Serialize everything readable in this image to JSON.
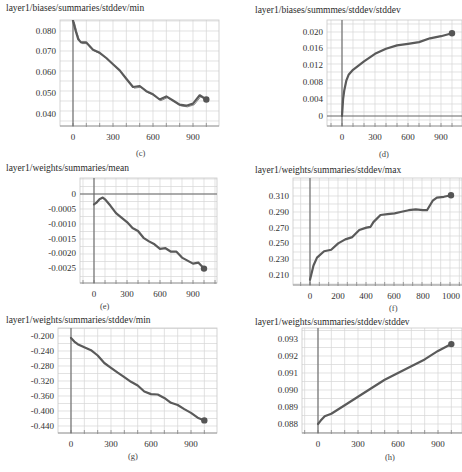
{
  "chart_data": [
    {
      "id": "c",
      "type": "line",
      "title": "layer1/biases/summaries/stddev/min",
      "caption": "(c)",
      "xlabel": "",
      "ylabel": "",
      "x_ticks": [
        "0",
        "300",
        "600",
        "900"
      ],
      "y_ticks": [
        "0.080",
        "0.070",
        "0.060",
        "0.050",
        "0.040"
      ],
      "xlim": [
        -120,
        1080
      ],
      "ylim": [
        0.035,
        0.085
      ],
      "grid": true,
      "x": [
        0,
        20,
        40,
        60,
        100,
        150,
        200,
        250,
        300,
        350,
        400,
        450,
        500,
        550,
        600,
        650,
        700,
        750,
        800,
        850,
        900,
        950,
        1000
      ],
      "values": [
        0.085,
        0.08,
        0.076,
        0.0745,
        0.0745,
        0.071,
        0.0695,
        0.067,
        0.064,
        0.061,
        0.057,
        0.053,
        0.0535,
        0.051,
        0.0495,
        0.047,
        0.0485,
        0.0465,
        0.0445,
        0.044,
        0.045,
        0.049,
        0.047
      ]
    },
    {
      "id": "d",
      "type": "line",
      "title": "layer1/biases/summmes/stddev/stddev",
      "caption": "(d)",
      "xlabel": "",
      "ylabel": "",
      "x_ticks": [
        "0",
        "300",
        "600",
        "900"
      ],
      "y_ticks": [
        "0.020",
        "0.016",
        "0.012",
        "0.008",
        "0.004",
        "0"
      ],
      "xlim": [
        -130,
        1110
      ],
      "ylim": [
        -0.002,
        0.023
      ],
      "grid": true,
      "x": [
        0,
        10,
        20,
        40,
        60,
        100,
        150,
        200,
        300,
        400,
        500,
        600,
        700,
        800,
        900,
        1000
      ],
      "values": [
        0.0,
        0.004,
        0.006,
        0.0085,
        0.0098,
        0.011,
        0.012,
        0.013,
        0.0148,
        0.016,
        0.0168,
        0.0172,
        0.0176,
        0.0185,
        0.019,
        0.0197
      ]
    },
    {
      "id": "e",
      "type": "line",
      "title": "layer1/weights/summaries/mean",
      "caption": "(e)",
      "xlabel": "",
      "ylabel": "",
      "x_ticks": [
        "0",
        "300",
        "600",
        "900"
      ],
      "y_ticks": [
        "0",
        "-0.0005",
        "-0.0010",
        "-0.0015",
        "-0.0020",
        "-0.0025"
      ],
      "xlim": [
        -130,
        1110
      ],
      "ylim": [
        -0.003,
        0.00035
      ],
      "grid": true,
      "x": [
        0,
        20,
        50,
        80,
        100,
        150,
        200,
        250,
        300,
        350,
        400,
        450,
        500,
        550,
        600,
        650,
        700,
        750,
        800,
        850,
        900,
        950,
        1000
      ],
      "values": [
        -0.00035,
        -0.0003,
        -0.00018,
        -0.00012,
        -0.00018,
        -0.0004,
        -0.00065,
        -0.0008,
        -0.00095,
        -0.00115,
        -0.00125,
        -0.00148,
        -0.0016,
        -0.0017,
        -0.00185,
        -0.00183,
        -0.00195,
        -0.00195,
        -0.00215,
        -0.00225,
        -0.00235,
        -0.00232,
        -0.00252
      ]
    },
    {
      "id": "f",
      "type": "line",
      "title": "layer1/weights/summaries/stddev/max",
      "caption": "(f)",
      "xlabel": "",
      "ylabel": "",
      "x_ticks": [
        "0",
        "200",
        "400",
        "600",
        "800",
        "1000"
      ],
      "y_ticks": [
        "0.310",
        "0.290",
        "0.270",
        "0.250",
        "0.230",
        "0.210"
      ],
      "xlim": [
        -120,
        1080
      ],
      "ylim": [
        0.202,
        0.328
      ],
      "grid": true,
      "x": [
        0,
        25,
        50,
        100,
        150,
        200,
        250,
        300,
        350,
        400,
        430,
        450,
        500,
        550,
        600,
        650,
        700,
        750,
        800,
        830,
        870,
        900,
        950,
        1000
      ],
      "values": [
        0.204,
        0.222,
        0.232,
        0.24,
        0.242,
        0.25,
        0.255,
        0.258,
        0.267,
        0.27,
        0.271,
        0.277,
        0.286,
        0.287,
        0.288,
        0.29,
        0.292,
        0.293,
        0.292,
        0.292,
        0.304,
        0.308,
        0.309,
        0.311
      ]
    },
    {
      "id": "g",
      "type": "line",
      "title": "layer1/weights/summaries/stddev/min",
      "caption": "(g)",
      "xlabel": "",
      "ylabel": "",
      "x_ticks": [
        "0",
        "300",
        "600",
        "900"
      ],
      "y_ticks": [
        "-0.200",
        "-0.240",
        "-0.280",
        "-0.320",
        "-0.360",
        "-0.400",
        "-0.440"
      ],
      "xlim": [
        -120,
        1080
      ],
      "ylim": [
        -0.46,
        -0.18
      ],
      "grid": true,
      "x": [
        0,
        25,
        50,
        100,
        150,
        200,
        250,
        300,
        350,
        400,
        450,
        500,
        550,
        600,
        650,
        700,
        750,
        800,
        850,
        900,
        950,
        1000
      ],
      "values": [
        -0.205,
        -0.215,
        -0.222,
        -0.23,
        -0.238,
        -0.252,
        -0.272,
        -0.285,
        -0.298,
        -0.31,
        -0.322,
        -0.332,
        -0.348,
        -0.355,
        -0.356,
        -0.365,
        -0.378,
        -0.384,
        -0.395,
        -0.405,
        -0.418,
        -0.425
      ]
    },
    {
      "id": "h",
      "type": "line",
      "title": "layer1/weights/summaries/stddev/stddev",
      "caption": "(h)",
      "xlabel": "",
      "ylabel": "",
      "x_ticks": [
        "0",
        "300",
        "600",
        "900"
      ],
      "y_ticks": [
        "0.093",
        "0.092",
        "0.091",
        "0.090",
        "0.089",
        "0.088"
      ],
      "xlim": [
        -120,
        1080
      ],
      "ylim": [
        0.0875,
        0.0933
      ],
      "grid": true,
      "x": [
        0,
        20,
        50,
        100,
        200,
        300,
        400,
        500,
        600,
        700,
        800,
        900,
        1000
      ],
      "values": [
        0.088,
        0.0882,
        0.08845,
        0.0886,
        0.0891,
        0.0896,
        0.0901,
        0.0906,
        0.091,
        0.0914,
        0.0918,
        0.0923,
        0.0927
      ]
    }
  ],
  "style": {
    "line_color": "#5a5a5a",
    "grid_color": "#d6d6d6",
    "axis_color": "#666666"
  }
}
